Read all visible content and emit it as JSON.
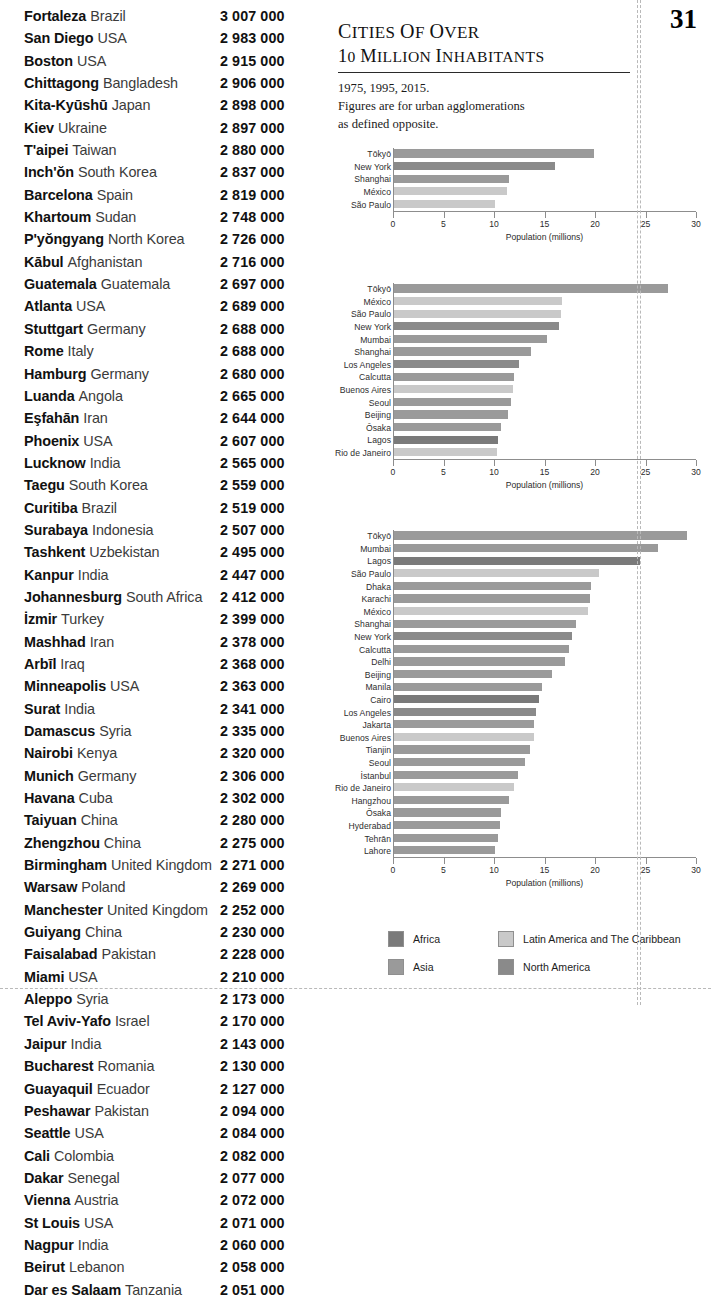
{
  "page": {
    "number": "31"
  },
  "header": {
    "title_line1": "Cities of over",
    "title_line2": "10 million inhabitants",
    "subtitle_line1": "1975, 1995, 2015.",
    "subtitle_line2": "Figures are for urban agglomerations",
    "subtitle_line3": "as defined opposite."
  },
  "colors": {
    "africa": "#7a7a7a",
    "asia": "#9a9a9a",
    "latin_america": "#c9c9c9",
    "north_america": "#8a8a8a",
    "axis": "#8d8d8d",
    "text": "#1b1b1b"
  },
  "city_list": {
    "rows": [
      {
        "city": "Fortaleza",
        "country": "Brazil",
        "population": "3 007 000"
      },
      {
        "city": "San Diego",
        "country": "USA",
        "population": "2 983 000"
      },
      {
        "city": "Boston",
        "country": "USA",
        "population": "2 915 000"
      },
      {
        "city": "Chittagong",
        "country": "Bangladesh",
        "population": "2 906 000"
      },
      {
        "city": "Kita-Kyūshū",
        "country": "Japan",
        "population": "2 898 000"
      },
      {
        "city": "Kiev",
        "country": "Ukraine",
        "population": "2 897 000"
      },
      {
        "city": "T'aipei",
        "country": "Taiwan",
        "population": "2 880 000"
      },
      {
        "city": "Inch'ŏn",
        "country": "South Korea",
        "population": "2 837 000"
      },
      {
        "city": "Barcelona",
        "country": "Spain",
        "population": "2 819 000"
      },
      {
        "city": "Khartoum",
        "country": "Sudan",
        "population": "2 748 000"
      },
      {
        "city": "P'yŏngyang",
        "country": "North Korea",
        "population": "2 726 000"
      },
      {
        "city": "Kābul",
        "country": "Afghanistan",
        "population": "2 716 000"
      },
      {
        "city": "Guatemala",
        "country": "Guatemala",
        "population": "2 697 000"
      },
      {
        "city": "Atlanta",
        "country": "USA",
        "population": "2 689 000"
      },
      {
        "city": "Stuttgart",
        "country": "Germany",
        "population": "2 688 000"
      },
      {
        "city": "Rome",
        "country": "Italy",
        "population": "2 688 000"
      },
      {
        "city": "Hamburg",
        "country": "Germany",
        "population": "2 680 000"
      },
      {
        "city": "Luanda",
        "country": "Angola",
        "population": "2 665 000"
      },
      {
        "city": "Eşfahān",
        "country": "Iran",
        "population": "2 644 000"
      },
      {
        "city": "Phoenix",
        "country": "USA",
        "population": "2 607 000"
      },
      {
        "city": "Lucknow",
        "country": "India",
        "population": "2 565 000"
      },
      {
        "city": "Taegu",
        "country": "South Korea",
        "population": "2 559 000"
      },
      {
        "city": "Curitiba",
        "country": "Brazil",
        "population": "2 519 000"
      },
      {
        "city": "Surabaya",
        "country": "Indonesia",
        "population": "2 507 000"
      },
      {
        "city": "Tashkent",
        "country": "Uzbekistan",
        "population": "2 495 000"
      },
      {
        "city": "Kanpur",
        "country": "India",
        "population": "2 447 000"
      },
      {
        "city": "Johannesburg",
        "country": "South Africa",
        "population": "2 412 000"
      },
      {
        "city": "İzmir",
        "country": "Turkey",
        "population": "2 399 000"
      },
      {
        "city": "Mashhad",
        "country": "Iran",
        "population": "2 378 000"
      },
      {
        "city": "Arbīl",
        "country": "Iraq",
        "population": "2 368 000"
      },
      {
        "city": "Minneapolis",
        "country": "USA",
        "population": "2 363 000"
      },
      {
        "city": "Surat",
        "country": "India",
        "population": "2 341 000"
      },
      {
        "city": "Damascus",
        "country": "Syria",
        "population": "2 335 000"
      },
      {
        "city": "Nairobi",
        "country": "Kenya",
        "population": "2 320 000"
      },
      {
        "city": "Munich",
        "country": "Germany",
        "population": "2 306 000"
      },
      {
        "city": "Havana",
        "country": "Cuba",
        "population": "2 302 000"
      },
      {
        "city": "Taiyuan",
        "country": "China",
        "population": "2 280 000"
      },
      {
        "city": "Zhengzhou",
        "country": "China",
        "population": "2 275 000"
      },
      {
        "city": "Birmingham",
        "country": "United Kingdom",
        "population": "2 271 000"
      },
      {
        "city": "Warsaw",
        "country": "Poland",
        "population": "2 269 000"
      },
      {
        "city": "Manchester",
        "country": "United Kingdom",
        "population": "2 252 000"
      },
      {
        "city": "Guiyang",
        "country": "China",
        "population": "2 230 000"
      },
      {
        "city": "Faisalabad",
        "country": "Pakistan",
        "population": "2 228 000"
      },
      {
        "city": "Miami",
        "country": "USA",
        "population": "2 210 000"
      },
      {
        "city": "Aleppo",
        "country": "Syria",
        "population": "2 173 000"
      },
      {
        "city": "Tel Aviv-Yafo",
        "country": "Israel",
        "population": "2 170 000"
      },
      {
        "city": "Jaipur",
        "country": "India",
        "population": "2 143 000"
      },
      {
        "city": "Bucharest",
        "country": "Romania",
        "population": "2 130 000"
      },
      {
        "city": "Guayaquil",
        "country": "Ecuador",
        "population": "2 127 000"
      },
      {
        "city": "Peshawar",
        "country": "Pakistan",
        "population": "2 094 000"
      },
      {
        "city": "Seattle",
        "country": "USA",
        "population": "2 084 000"
      },
      {
        "city": "Cali",
        "country": "Colombia",
        "population": "2 082 000"
      },
      {
        "city": "Dakar",
        "country": "Senegal",
        "population": "2 077 000"
      },
      {
        "city": "Vienna",
        "country": "Austria",
        "population": "2 072 000"
      },
      {
        "city": "St Louis",
        "country": "USA",
        "population": "2 071 000"
      },
      {
        "city": "Nagpur",
        "country": "India",
        "population": "2 060 000"
      },
      {
        "city": "Beirut",
        "country": "Lebanon",
        "population": "2 058 000"
      },
      {
        "city": "Dar es Salaam",
        "country": "Tanzania",
        "population": "2 051 000"
      }
    ]
  },
  "legend": {
    "items": [
      {
        "label": "Africa",
        "color": "#7a7a7a",
        "region": "africa"
      },
      {
        "label": "Latin America and The Caribbean",
        "color": "#c9c9c9",
        "region": "latin_america"
      },
      {
        "label": "Asia",
        "color": "#9a9a9a",
        "region": "asia"
      },
      {
        "label": "North America",
        "color": "#8a8a8a",
        "region": "north_america"
      }
    ]
  },
  "chart_data": [
    {
      "type": "bar",
      "orientation": "horizontal",
      "title": "1975",
      "xlabel": "Population (millions)",
      "ylabel": "",
      "xlim": [
        0,
        30
      ],
      "xticks": [
        0,
        5,
        10,
        15,
        20,
        25,
        30
      ],
      "grid": false,
      "categories": [
        "Tōkyō",
        "New York",
        "Shanghai",
        "México",
        "São Paulo"
      ],
      "values": [
        19.8,
        15.9,
        11.4,
        11.2,
        10.0
      ],
      "regions": [
        "asia",
        "north_america",
        "asia",
        "latin_america",
        "latin_america"
      ]
    },
    {
      "type": "bar",
      "orientation": "horizontal",
      "title": "1995",
      "xlabel": "Population (millions)",
      "ylabel": "",
      "xlim": [
        0,
        30
      ],
      "xticks": [
        0,
        5,
        10,
        15,
        20,
        25,
        30
      ],
      "grid": false,
      "categories": [
        "Tōkyō",
        "México",
        "São Paulo",
        "New York",
        "Mumbai",
        "Shanghai",
        "Los Angeles",
        "Calcutta",
        "Buenos Aires",
        "Seoul",
        "Beijing",
        "Ōsaka",
        "Lagos",
        "Rio de Janeiro"
      ],
      "values": [
        27.1,
        16.6,
        16.5,
        16.3,
        15.1,
        13.6,
        12.4,
        11.9,
        11.8,
        11.6,
        11.3,
        10.6,
        10.3,
        10.2
      ],
      "regions": [
        "asia",
        "latin_america",
        "latin_america",
        "north_america",
        "asia",
        "asia",
        "north_america",
        "asia",
        "latin_america",
        "asia",
        "asia",
        "asia",
        "africa",
        "latin_america"
      ]
    },
    {
      "type": "bar",
      "orientation": "horizontal",
      "title": "2015",
      "xlabel": "Population (millions)",
      "ylabel": "",
      "xlim": [
        0,
        30
      ],
      "xticks": [
        0,
        5,
        10,
        15,
        20,
        25,
        30
      ],
      "grid": false,
      "categories": [
        "Tōkyō",
        "Mumbai",
        "Lagos",
        "São Paulo",
        "Dhaka",
        "Karachi",
        "México",
        "Shanghai",
        "New York",
        "Calcutta",
        "Delhi",
        "Beijing",
        "Manila",
        "Cairo",
        "Los Angeles",
        "Jakarta",
        "Buenos Aires",
        "Tianjin",
        "Seoul",
        "İstanbul",
        "Rio de Janeiro",
        "Hangzhou",
        "Ōsaka",
        "Hyderabad",
        "Tehrān",
        "Lahore"
      ],
      "values": [
        29.0,
        26.1,
        24.4,
        20.3,
        19.5,
        19.4,
        19.2,
        18.0,
        17.6,
        17.3,
        16.9,
        15.6,
        14.7,
        14.4,
        14.1,
        13.9,
        13.9,
        13.5,
        13.0,
        12.3,
        11.9,
        11.4,
        10.6,
        10.5,
        10.3,
        10.0
      ],
      "regions": [
        "asia",
        "asia",
        "africa",
        "latin_america",
        "asia",
        "asia",
        "latin_america",
        "asia",
        "north_america",
        "asia",
        "asia",
        "asia",
        "asia",
        "africa",
        "north_america",
        "asia",
        "latin_america",
        "asia",
        "asia",
        "asia",
        "latin_america",
        "asia",
        "asia",
        "asia",
        "asia",
        "asia"
      ]
    }
  ]
}
